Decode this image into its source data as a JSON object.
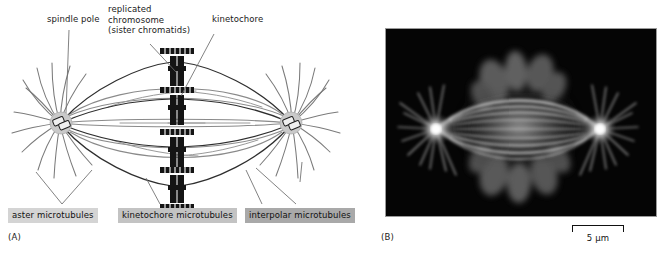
{
  "figure": {
    "panels": [
      {
        "letter": "(A)",
        "kind": "diagram"
      },
      {
        "letter": "(B)",
        "kind": "fluorescence-micrograph"
      }
    ]
  },
  "panel_a": {
    "letter": "(A)",
    "callouts": [
      {
        "id": "spindle-pole",
        "text": "spindle pole"
      },
      {
        "id": "replicated-chromosome",
        "text": "replicated\nchromosome\n(sister chromatids)"
      },
      {
        "id": "kinetochore",
        "text": "kinetochore"
      }
    ],
    "box_labels": [
      {
        "id": "aster-microtubules",
        "text": "aster microtubules",
        "bg": "#d4d4d4"
      },
      {
        "id": "kinetochore-microtubules",
        "text": "kinetochore microtubules",
        "bg": "#c3c3c3"
      },
      {
        "id": "interpolar-microtubules",
        "text": "interpolar microtubules",
        "bg": "#a9a9a9"
      }
    ],
    "structures": {
      "poles": 2,
      "chromosomes": 4,
      "centrioles_per_pole": 2,
      "line_color": "#6f6f6f",
      "dark_line_color": "#2a2a2a",
      "chromosome_color": "#111111"
    }
  },
  "panel_b": {
    "letter": "(B)",
    "background": "#040404",
    "scale_bar": {
      "label": "5 µm",
      "value": 5,
      "unit": "µm"
    },
    "features": {
      "asters": 2,
      "spindle_color": "#d8d8d8",
      "chromatin_color": "#6a6a6a"
    }
  }
}
